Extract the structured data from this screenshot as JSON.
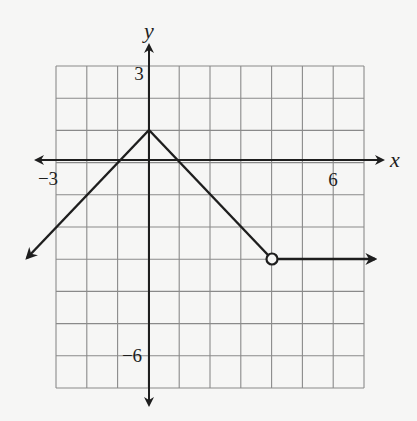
{
  "chart_data": {
    "type": "line",
    "title": "",
    "xlabel": "x",
    "ylabel": "y",
    "xlim": [
      -3,
      7
    ],
    "ylim": [
      -7,
      3
    ],
    "grid": true,
    "tick_labels": {
      "x": [
        {
          "value": -3,
          "label": "−3"
        },
        {
          "value": 6,
          "label": "6"
        }
      ],
      "y": [
        {
          "value": 3,
          "label": "3"
        },
        {
          "value": -6,
          "label": "−6"
        }
      ]
    },
    "series": [
      {
        "name": "piecewise function",
        "segments": [
          {
            "from": [
              -3.9,
              -3.1
            ],
            "to": [
              0,
              1
            ],
            "arrow_start": true,
            "note": "ray continuing down-left, slope 1"
          },
          {
            "from": [
              0,
              1
            ],
            "to": [
              4,
              -3
            ],
            "end_marker": "open-circle",
            "note": "slope -1"
          },
          {
            "from": [
              4,
              -3
            ],
            "to": [
              7.3,
              -3
            ],
            "arrow_end": true,
            "start_marker": "open-circle",
            "note": "horizontal ray"
          }
        ],
        "key_points": [
          {
            "x": -1,
            "y": 0
          },
          {
            "x": 0,
            "y": 1,
            "label": "vertex"
          },
          {
            "x": 1,
            "y": 0
          },
          {
            "x": 4,
            "y": -3,
            "marker": "open"
          }
        ]
      }
    ],
    "legend": null
  },
  "labels": {
    "x_axis": "x",
    "y_axis": "y",
    "tick_neg3": "−3",
    "tick_6": "6",
    "tick_3": "3",
    "tick_neg6": "−6"
  },
  "colors": {
    "background": "#f6f6f5",
    "grid": "#8a8a8a",
    "axes": "#1e1e1e",
    "curve": "#1e1e1e"
  }
}
